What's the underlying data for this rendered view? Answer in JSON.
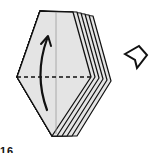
{
  "diagram": {
    "type": "origami-fold-step",
    "colors": {
      "paper": "#e4e4e4",
      "outline": "#111111",
      "background": "#ffffff"
    },
    "front_layer": {
      "points": "40,11 73,12 91,77 52,136 17,77"
    },
    "back_layers": [
      {
        "points": "75,12 93,77 57,136 54,135 91,77 73,12"
      },
      {
        "points": "79,13 97,78 62,136 59,135 95,78 77,13"
      },
      {
        "points": "83,14 101,79 67,136 64,135 99,79 81,14"
      },
      {
        "points": "87,15 105,80 72,136 69,135 103,80 85,15"
      },
      {
        "points": "91,16 109,81 77,136 74,135 107,81 89,16"
      }
    ],
    "valley_fold_line": {
      "x1": 17,
      "y1": 77,
      "x2": 92,
      "y2": 77,
      "label": "valley fold"
    },
    "center_crease": {
      "x1": 56,
      "y1": 12,
      "x2": 56,
      "y2": 134
    },
    "fold_arrow": {
      "direction": "up",
      "path": "M 47 110 Q 34 75 47 39"
    },
    "turn_over_symbol": {
      "label": "turn over",
      "x": 125,
      "y": 47
    },
    "caption": "16"
  }
}
